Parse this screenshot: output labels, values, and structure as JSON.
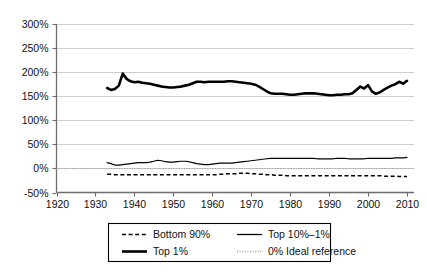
{
  "chart_data": {
    "type": "line",
    "title": "",
    "subtitle": "",
    "xlabel": "",
    "ylabel": "",
    "xlim": [
      1920,
      2010
    ],
    "ylim": [
      -50,
      300
    ],
    "grid": true,
    "legend_position": "bottom",
    "y_ticks": [
      "-50%",
      "0%",
      "50%",
      "100%",
      "150%",
      "200%",
      "250%",
      "300%"
    ],
    "y_tick_values": [
      -50,
      0,
      50,
      100,
      150,
      200,
      250,
      300
    ],
    "x_ticks": [
      "1920",
      "1930",
      "1940",
      "1950",
      "1960",
      "1970",
      "1980",
      "1990",
      "2000",
      "2010"
    ],
    "x_tick_values": [
      1920,
      1930,
      1940,
      1950,
      1960,
      1970,
      1980,
      1990,
      2000,
      2010
    ],
    "x": [
      1933,
      1934,
      1935,
      1936,
      1937,
      1938,
      1939,
      1940,
      1941,
      1942,
      1943,
      1944,
      1945,
      1946,
      1947,
      1948,
      1949,
      1950,
      1951,
      1952,
      1953,
      1954,
      1955,
      1956,
      1957,
      1958,
      1959,
      1960,
      1961,
      1962,
      1963,
      1964,
      1965,
      1966,
      1967,
      1968,
      1969,
      1970,
      1971,
      1972,
      1973,
      1974,
      1975,
      1976,
      1977,
      1978,
      1979,
      1980,
      1981,
      1982,
      1983,
      1984,
      1985,
      1986,
      1987,
      1988,
      1989,
      1990,
      1991,
      1992,
      1993,
      1994,
      1995,
      1996,
      1997,
      1998,
      1999,
      2000,
      2001,
      2002,
      2003,
      2004,
      2005,
      2006,
      2007,
      2008,
      2009,
      2010
    ],
    "series": [
      {
        "name": "Top 1%",
        "style": "solid-thick",
        "color": "#000000",
        "values": [
          167,
          163,
          165,
          172,
          197,
          186,
          181,
          179,
          180,
          178,
          177,
          176,
          174,
          172,
          170,
          169,
          168,
          168,
          169,
          170,
          172,
          174,
          177,
          180,
          180,
          179,
          180,
          180,
          180,
          180,
          180,
          181,
          181,
          180,
          179,
          178,
          177,
          176,
          174,
          170,
          165,
          160,
          156,
          155,
          155,
          155,
          154,
          153,
          153,
          154,
          155,
          156,
          156,
          156,
          155,
          154,
          153,
          152,
          152,
          153,
          153,
          154,
          154,
          156,
          163,
          170,
          166,
          173,
          160,
          155,
          158,
          163,
          168,
          172,
          175,
          180,
          176,
          182
        ]
      },
      {
        "name": "Top 10%–1%",
        "style": "solid-thin",
        "color": "#000000",
        "values": [
          12,
          10,
          7,
          7,
          8,
          9,
          10,
          11,
          12,
          12,
          12,
          13,
          15,
          17,
          16,
          14,
          13,
          13,
          14,
          15,
          15,
          14,
          12,
          10,
          9,
          8,
          8,
          9,
          10,
          11,
          11,
          11,
          11,
          12,
          13,
          14,
          15,
          16,
          17,
          18,
          19,
          20,
          21,
          21,
          21,
          21,
          21,
          21,
          21,
          21,
          21,
          21,
          21,
          21,
          20,
          20,
          20,
          20,
          20,
          21,
          21,
          21,
          20,
          20,
          20,
          20,
          20,
          21,
          21,
          21,
          21,
          21,
          21,
          21,
          22,
          22,
          22,
          23
        ]
      },
      {
        "name": "Bottom 90%",
        "style": "dashed",
        "color": "#000000",
        "values": [
          -12,
          -12,
          -13,
          -13,
          -13,
          -13,
          -13,
          -13,
          -13,
          -13,
          -13,
          -13,
          -13,
          -13,
          -13,
          -13,
          -13,
          -13,
          -13,
          -13,
          -13,
          -13,
          -13,
          -13,
          -13,
          -13,
          -13,
          -13,
          -13,
          -12,
          -12,
          -11,
          -11,
          -11,
          -10,
          -10,
          -10,
          -11,
          -11,
          -12,
          -12,
          -13,
          -13,
          -14,
          -14,
          -14,
          -15,
          -15,
          -15,
          -15,
          -15,
          -15,
          -15,
          -15,
          -15,
          -15,
          -15,
          -15,
          -15,
          -15,
          -15,
          -15,
          -15,
          -15,
          -15,
          -15,
          -15,
          -15,
          -15,
          -15,
          -15,
          -16,
          -16,
          -16,
          -16,
          -17,
          -17,
          -17
        ]
      },
      {
        "name": "0% Ideal reference",
        "style": "dotted",
        "color": "#9a9a9a",
        "constant": 0
      }
    ],
    "legend": [
      {
        "label": "Bottom 90%",
        "style": "dashed",
        "color": "#000000"
      },
      {
        "label": "Top 10%–1%",
        "style": "solid-thin",
        "color": "#000000"
      },
      {
        "label": "Top 1%",
        "style": "solid-thick",
        "color": "#000000"
      },
      {
        "label": "0% Ideal reference",
        "style": "dotted",
        "color": "#9a9a9a"
      }
    ]
  },
  "colors": {
    "background": "#ffffff",
    "gridline": "#b9b9b9",
    "axis": "#6e6e6e",
    "ink": "#000000",
    "reference": "#9a9a9a"
  }
}
